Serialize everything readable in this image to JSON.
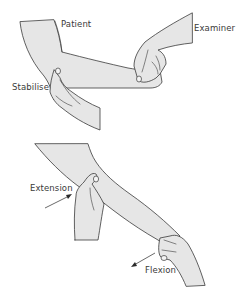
{
  "figure": {
    "colors": {
      "skin_fill": "#e6e6e6",
      "outline": "#3a3a3a",
      "text": "#3a3a3a",
      "background": "#ffffff"
    },
    "top_panel": {
      "labels": {
        "patient": "Patient",
        "examiner": "Examiner",
        "stabilise": "Stabilise"
      }
    },
    "bottom_panel": {
      "labels": {
        "extension": "Extension",
        "flexion": "Flexion"
      },
      "arrows": [
        {
          "name": "extension-arrow",
          "direction": "up-right"
        },
        {
          "name": "flexion-arrow",
          "direction": "down-left"
        }
      ]
    }
  }
}
